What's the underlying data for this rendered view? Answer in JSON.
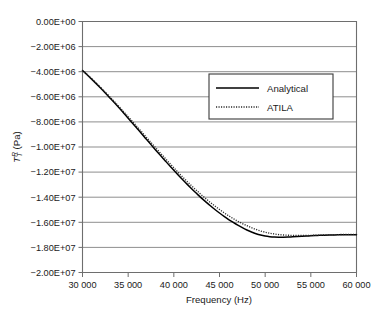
{
  "chart_data": {
    "type": "line",
    "title": "",
    "xlabel": "Frequency (Hz)",
    "ylabel": "Tᵀᴿ (Pa)",
    "ylabel_parts": {
      "symbol": "T",
      "sub": "T",
      "sup": "R",
      "unit": " (Pa)"
    },
    "xlim": [
      30000,
      60000
    ],
    "ylim": [
      -20000000,
      0
    ],
    "xtick_step": 5000,
    "ytick_step": 2000000,
    "grid": "horizontal",
    "legend_position": "upper-right-inside",
    "xticklabels": [
      "30 000",
      "35 000",
      "40 000",
      "45 000",
      "50 000",
      "55 000",
      "60 000"
    ],
    "xticks": [
      30000,
      35000,
      40000,
      45000,
      50000,
      55000,
      60000
    ],
    "yticklabels": [
      "0.00E+00",
      "−2.00E+06",
      "−4.00E+06",
      "−6.00E+06",
      "−8.00E+06",
      "−1.00E+07",
      "−1.20E+07",
      "−1.40E+07",
      "−1.60E+07",
      "−1.80E+07",
      "−2.00E+07"
    ],
    "yticks": [
      0,
      -2000000,
      -4000000,
      -6000000,
      -8000000,
      -10000000,
      -12000000,
      -14000000,
      -16000000,
      -18000000,
      -20000000
    ],
    "x": [
      30000,
      30500,
      31000,
      31500,
      32000,
      32500,
      33000,
      33500,
      34000,
      34500,
      35000,
      35500,
      36000,
      36500,
      37000,
      37500,
      38000,
      38500,
      39000,
      39500,
      40000,
      40500,
      41000,
      41500,
      42000,
      42500,
      43000,
      43500,
      44000,
      44500,
      45000,
      45500,
      46000,
      46500,
      47000,
      47500,
      48000,
      48500,
      49000,
      49500,
      50000,
      50500,
      51000,
      51500,
      52000,
      52500,
      53000,
      53500,
      54000,
      54500,
      55000,
      55500,
      56000,
      56500,
      57000,
      57500,
      58000,
      58500,
      59000,
      59500,
      60000
    ],
    "series": [
      {
        "name": "Analytical",
        "style": "solid",
        "color": "#000000",
        "values": [
          -3900000,
          -4240000,
          -4590000,
          -4950000,
          -5320000,
          -5700000,
          -6090000,
          -6480000,
          -6880000,
          -7290000,
          -7700000,
          -8120000,
          -8540000,
          -8960000,
          -9390000,
          -9810000,
          -10230000,
          -10640000,
          -11050000,
          -11460000,
          -11860000,
          -12250000,
          -12630000,
          -13000000,
          -13360000,
          -13710000,
          -14050000,
          -14370000,
          -14680000,
          -14980000,
          -15260000,
          -15530000,
          -15780000,
          -16010000,
          -16230000,
          -16430000,
          -16610000,
          -16770000,
          -16910000,
          -17020000,
          -17100000,
          -17150000,
          -17180000,
          -17190000,
          -17190000,
          -17180000,
          -17160000,
          -17140000,
          -17120000,
          -17100000,
          -17080000,
          -17060000,
          -17040000,
          -17030000,
          -17020000,
          -17010000,
          -17000000,
          -17000000,
          -16990000,
          -16990000,
          -16990000
        ]
      },
      {
        "name": "ATILA",
        "style": "dotted",
        "color": "#2b2b2b",
        "values": [
          -3880000,
          -4210000,
          -4550000,
          -4900000,
          -5260000,
          -5630000,
          -6010000,
          -6390000,
          -6780000,
          -7180000,
          -7580000,
          -7990000,
          -8400000,
          -8810000,
          -9230000,
          -9640000,
          -10050000,
          -10460000,
          -10860000,
          -11260000,
          -11650000,
          -12040000,
          -12410000,
          -12780000,
          -13130000,
          -13470000,
          -13800000,
          -14120000,
          -14420000,
          -14710000,
          -14980000,
          -15240000,
          -15480000,
          -15700000,
          -15910000,
          -16100000,
          -16270000,
          -16430000,
          -16570000,
          -16690000,
          -16790000,
          -16870000,
          -16930000,
          -16980000,
          -17010000,
          -17030000,
          -17040000,
          -17050000,
          -17050000,
          -17050000,
          -17040000,
          -17030000,
          -17020000,
          -17010000,
          -17000000,
          -16990000,
          -16980000,
          -16970000,
          -16960000,
          -16960000,
          -16960000
        ]
      }
    ],
    "legend": [
      {
        "label": "Analytical",
        "style": "solid"
      },
      {
        "label": "ATILA",
        "style": "dotted"
      }
    ]
  }
}
